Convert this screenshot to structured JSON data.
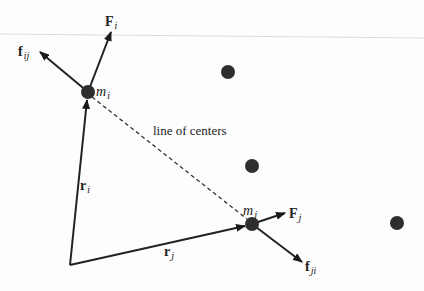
{
  "diagram": {
    "title": "",
    "colors": {
      "stroke": "#222222",
      "node": "#2e2e2e",
      "background": "#fdfdfd",
      "faint_line": "#d8d8d8"
    },
    "nodes": [
      {
        "id": "m_i",
        "label": "m",
        "sub": "i",
        "x": 88,
        "y": 92
      },
      {
        "id": "m_j",
        "label": "m",
        "sub": "j",
        "x": 252,
        "y": 224
      },
      {
        "id": "p1",
        "label": "",
        "x": 228,
        "y": 72
      },
      {
        "id": "p2",
        "label": "",
        "x": 252,
        "y": 166
      },
      {
        "id": "p3",
        "label": "",
        "x": 397,
        "y": 223
      }
    ],
    "origin": {
      "x": 70,
      "y": 265
    },
    "vectors": [
      {
        "id": "r_i",
        "label": "r",
        "sub": "i",
        "from": [
          70,
          265
        ],
        "to": [
          88,
          92
        ]
      },
      {
        "id": "r_j",
        "label": "r",
        "sub": "j",
        "from": [
          70,
          265
        ],
        "to": [
          252,
          224
        ]
      },
      {
        "id": "F_i",
        "label": "F",
        "sub": "i",
        "from": [
          88,
          92
        ],
        "to": [
          111,
          32
        ]
      },
      {
        "id": "f_ij",
        "label": "f",
        "sub": "ij",
        "from": [
          88,
          92
        ],
        "to": [
          40,
          52
        ]
      },
      {
        "id": "F_j",
        "label": "F",
        "sub": "j",
        "from": [
          252,
          224
        ],
        "to": [
          285,
          213
        ]
      },
      {
        "id": "f_ji",
        "label": "f",
        "sub": "ji",
        "from": [
          252,
          224
        ],
        "to": [
          302,
          262
        ]
      }
    ],
    "dashed_line": {
      "label": "line of centers",
      "from": [
        88,
        92
      ],
      "to": [
        252,
        224
      ]
    },
    "labels": {
      "m_i": {
        "main": "m",
        "sub": "i"
      },
      "m_j": {
        "main": "m",
        "sub": "j"
      },
      "F_i": {
        "main": "F",
        "sub": "i"
      },
      "f_ij": {
        "main": "f",
        "sub": "ij"
      },
      "F_j": {
        "main": "F",
        "sub": "j"
      },
      "f_ji": {
        "main": "f",
        "sub": "ji"
      },
      "r_i": {
        "main": "r",
        "sub": "i"
      },
      "r_j": {
        "main": "r",
        "sub": "j"
      },
      "line_of_centers": "line of centers"
    }
  }
}
